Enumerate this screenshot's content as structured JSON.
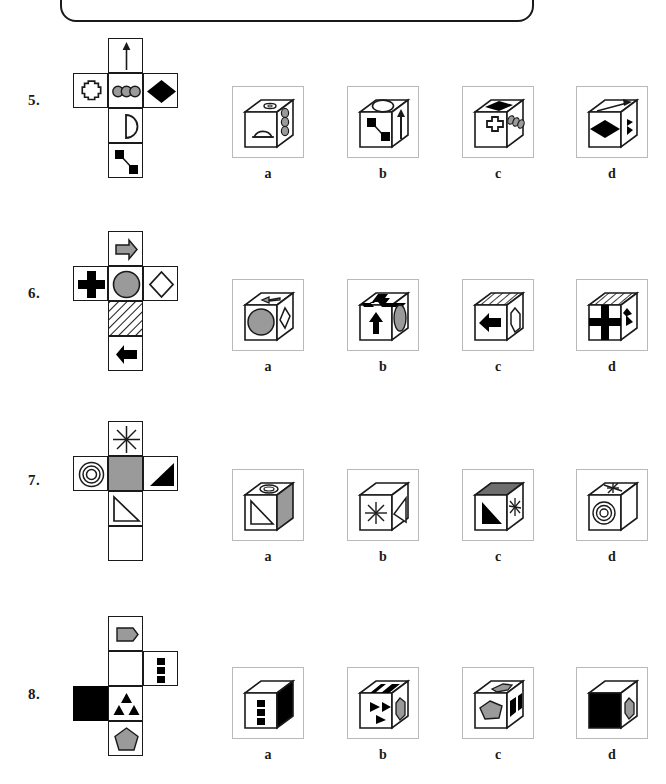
{
  "page": {
    "background_color": "#ffffff",
    "ink_color": "#1a1a1a",
    "gray_fill": "#9a9a9a",
    "answer_box_border": "#b9b9b9"
  },
  "answer_labels": [
    "a",
    "b",
    "c",
    "d"
  ],
  "questions": [
    {
      "number": "5.",
      "net": {
        "layout": "latin-cross",
        "faces": [
          {
            "position": "top",
            "icon": "up-arrow",
            "fill": "white"
          },
          {
            "position": "middle-left",
            "icon": "small-cross-outline",
            "fill": "white"
          },
          {
            "position": "middle-center",
            "icon": "three-gray-circles",
            "fill": "white"
          },
          {
            "position": "middle-right",
            "icon": "black-diamond",
            "fill": "white"
          },
          {
            "position": "lower",
            "icon": "half-disc",
            "fill": "white"
          },
          {
            "position": "bottom",
            "icon": "two-black-squares-connector",
            "fill": "white"
          }
        ]
      },
      "answers": [
        {
          "label": "a",
          "faces": {
            "top": "small-cross-outline",
            "front": "half-disc",
            "right": "three-gray-circles"
          }
        },
        {
          "label": "b",
          "faces": {
            "top": "half-disc",
            "front": "two-black-squares-connector",
            "right": "up-arrow"
          }
        },
        {
          "label": "c",
          "faces": {
            "top": "black-diamond",
            "front": "small-cross-outline",
            "right": "three-gray-circles"
          }
        },
        {
          "label": "d",
          "faces": {
            "top": "up-arrow",
            "front": "black-diamond",
            "right": "half-disc"
          }
        }
      ]
    },
    {
      "number": "6.",
      "net": {
        "layout": "latin-cross",
        "faces": [
          {
            "position": "top",
            "icon": "gray-right-arrow",
            "fill": "white"
          },
          {
            "position": "middle-left",
            "icon": "black-plus-cross",
            "fill": "white"
          },
          {
            "position": "middle-center",
            "icon": "gray-circle",
            "fill": "white"
          },
          {
            "position": "middle-right",
            "icon": "white-diamond-outline",
            "fill": "white"
          },
          {
            "position": "lower",
            "icon": "diagonal-hatch",
            "fill": "hatched"
          },
          {
            "position": "bottom",
            "icon": "black-left-arrow",
            "fill": "white"
          }
        ]
      },
      "answers": [
        {
          "label": "a",
          "faces": {
            "top": "gray-left-arrow",
            "front": "gray-circle",
            "right": "white-diamond-outline"
          }
        },
        {
          "label": "b",
          "faces": {
            "top": "black-plus-cross",
            "front": "black-up-arrow",
            "right": "gray-circle"
          }
        },
        {
          "label": "c",
          "faces": {
            "top": "diagonal-hatch",
            "front": "black-left-arrow",
            "right": "white-diamond-outline"
          }
        },
        {
          "label": "d",
          "faces": {
            "top": "diagonal-hatch",
            "front": "black-plus-cross",
            "right": "black-arrow-partial"
          }
        }
      ]
    },
    {
      "number": "7.",
      "net": {
        "layout": "latin-cross",
        "faces": [
          {
            "position": "top",
            "icon": "eight-point-star",
            "fill": "white"
          },
          {
            "position": "middle-left",
            "icon": "concentric-circles",
            "fill": "white"
          },
          {
            "position": "middle-center",
            "icon": "none",
            "fill": "gray"
          },
          {
            "position": "middle-right",
            "icon": "black-triangle",
            "fill": "white"
          },
          {
            "position": "lower",
            "icon": "outline-triangle",
            "fill": "white"
          },
          {
            "position": "bottom",
            "icon": "none",
            "fill": "white"
          }
        ]
      },
      "answers": [
        {
          "label": "a",
          "faces": {
            "top": "concentric-circles",
            "front": "outline-triangle",
            "right": "gray-blank"
          }
        },
        {
          "label": "b",
          "faces": {
            "top": "blank",
            "front": "eight-point-star",
            "right": "outline-triangle"
          }
        },
        {
          "label": "c",
          "faces": {
            "top": "gray-blank",
            "front": "black-triangle",
            "right": "eight-point-star"
          }
        },
        {
          "label": "d",
          "faces": {
            "top": "eight-point-star",
            "front": "concentric-circles",
            "right": "blank"
          }
        }
      ]
    },
    {
      "number": "8.",
      "net": {
        "layout": "column-with-side-flaps",
        "faces": [
          {
            "position": "col-row1",
            "icon": "gray-pentagon-banner",
            "fill": "white"
          },
          {
            "position": "col-row2",
            "icon": "none",
            "fill": "white"
          },
          {
            "position": "right-row2",
            "icon": "three-black-squares",
            "fill": "white"
          },
          {
            "position": "col-row3",
            "icon": "three-black-triangles",
            "fill": "white"
          },
          {
            "position": "left-row3",
            "icon": "none",
            "fill": "black"
          },
          {
            "position": "col-row4",
            "icon": "gray-pentagon",
            "fill": "white"
          }
        ]
      },
      "answers": [
        {
          "label": "a",
          "faces": {
            "top": "blank",
            "front": "three-black-squares",
            "right": "black-fill"
          }
        },
        {
          "label": "b",
          "faces": {
            "top": "black-stripe",
            "front": "three-black-triangles",
            "right": "gray-pentagon"
          }
        },
        {
          "label": "c",
          "faces": {
            "top": "gray-pentagon-banner",
            "front": "gray-pentagon",
            "right": "black-stripe"
          }
        },
        {
          "label": "d",
          "faces": {
            "top": "blank",
            "front": "black-fill",
            "right": "gray-pentagon"
          }
        }
      ]
    }
  ]
}
